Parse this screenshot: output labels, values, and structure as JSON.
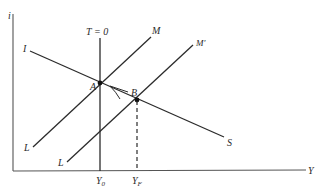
{
  "diagram": {
    "type": "IS-LM diagram",
    "axes": {
      "y_label": "i",
      "x_label": "Y"
    },
    "curves": {
      "vertical_line_label": "T = 0",
      "is_curve": {
        "start_label": "I",
        "end_label": "S"
      },
      "lm_curve": {
        "start_label": "L",
        "end_label": "M"
      },
      "lm_shifted_curve": {
        "start_label": "L",
        "end_label": "M′"
      }
    },
    "points": {
      "a": "A",
      "b": "B"
    },
    "x_ticks": {
      "y0_main": "Y",
      "y0_sub": "0",
      "yf_main": "Y",
      "yf_sub": "F"
    },
    "colors": {
      "line": "#2b2b2b",
      "axis": "#555555",
      "background": "#ffffff"
    }
  }
}
